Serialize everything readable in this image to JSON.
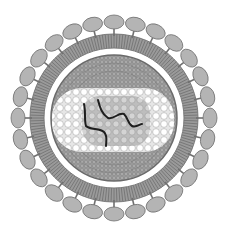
{
  "diagram": {
    "center": [
      114,
      118
    ],
    "spikes": {
      "count": 28,
      "radius": 96,
      "rx": 10,
      "ry": 7,
      "fill": "#b4b4b4",
      "stroke": "#707070"
    },
    "membrane": {
      "outer_r": 84,
      "inner_r": 70,
      "fill": "#9a9a9a",
      "stripe": "#6e6e6e"
    },
    "gap": {
      "r": 67,
      "fill": "#ffffff"
    },
    "capsid": {
      "r": 63,
      "fill": "#8c8c8c",
      "mesh": "#5e5e5e"
    },
    "nucleocapsid": {
      "x": 52,
      "y": 88,
      "w": 122,
      "h": 64,
      "rx": 30,
      "fill": "#e6e6e6",
      "bead": "#ffffff",
      "bead_stroke": "#a8a8a8"
    },
    "core": {
      "x": 82,
      "y": 96,
      "w": 68,
      "h": 50,
      "rx": 18,
      "fill": "#bdbdbd"
    },
    "genome_color": "#1e1e1e"
  }
}
